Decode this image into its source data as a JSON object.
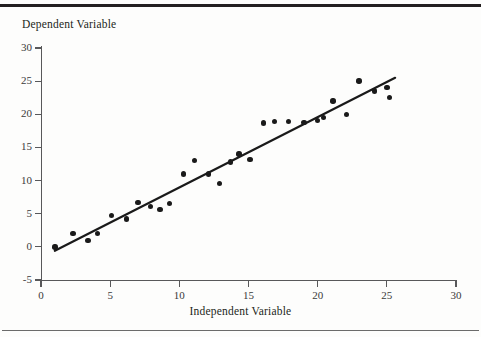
{
  "figure": {
    "background_color": "#fdfdfc",
    "rule_color": "#231f20",
    "marker_color": "#1a1a1a",
    "line_color": "#1a1a1a",
    "axis_color": "#58585a"
  },
  "chart_data": {
    "type": "scatter",
    "title": "",
    "xlabel": "Independent Variable",
    "ylabel": "Dependent Variable",
    "xlim": [
      0,
      30
    ],
    "ylim": [
      -5,
      30
    ],
    "xticks": [
      0,
      5,
      10,
      15,
      20,
      25,
      30
    ],
    "yticks": [
      -5,
      0,
      5,
      10,
      15,
      20,
      25,
      30
    ],
    "xtick_labels": [
      "0",
      "5",
      "10",
      "15",
      "20",
      "25",
      "30"
    ],
    "ytick_labels": [
      "-5",
      "0",
      "5",
      "10",
      "15",
      "20",
      "25",
      "30"
    ],
    "grid": false,
    "legend": null,
    "series": [
      {
        "name": "observations",
        "type": "scatter",
        "marker": "circle",
        "color": "#1a1a1a",
        "points": [
          {
            "x": 1.0,
            "y": 0.0
          },
          {
            "x": 2.3,
            "y": 2.0
          },
          {
            "x": 3.4,
            "y": 1.0
          },
          {
            "x": 4.1,
            "y": 2.0
          },
          {
            "x": 5.1,
            "y": 4.7
          },
          {
            "x": 6.2,
            "y": 4.2
          },
          {
            "x": 7.0,
            "y": 6.7
          },
          {
            "x": 7.9,
            "y": 6.1
          },
          {
            "x": 8.6,
            "y": 5.6
          },
          {
            "x": 9.3,
            "y": 6.5
          },
          {
            "x": 10.3,
            "y": 11.0
          },
          {
            "x": 11.1,
            "y": 13.0
          },
          {
            "x": 12.1,
            "y": 11.0
          },
          {
            "x": 12.9,
            "y": 9.6
          },
          {
            "x": 13.7,
            "y": 12.8
          },
          {
            "x": 14.3,
            "y": 14.0
          },
          {
            "x": 15.1,
            "y": 13.2
          },
          {
            "x": 16.1,
            "y": 18.7
          },
          {
            "x": 16.9,
            "y": 18.9
          },
          {
            "x": 17.9,
            "y": 18.9
          },
          {
            "x": 19.0,
            "y": 18.8
          },
          {
            "x": 20.0,
            "y": 19.1
          },
          {
            "x": 20.4,
            "y": 19.5
          },
          {
            "x": 21.1,
            "y": 22.0
          },
          {
            "x": 22.1,
            "y": 20.0
          },
          {
            "x": 23.0,
            "y": 25.0
          },
          {
            "x": 24.1,
            "y": 23.5
          },
          {
            "x": 25.0,
            "y": 24.0
          },
          {
            "x": 25.2,
            "y": 22.5
          }
        ]
      },
      {
        "name": "regression-line",
        "type": "line",
        "color": "#1a1a1a",
        "x_start": 1.0,
        "y_start": -0.6,
        "x_end": 25.6,
        "y_end": 25.5
      }
    ]
  }
}
